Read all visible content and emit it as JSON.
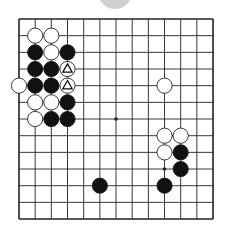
{
  "board": {
    "size": 13,
    "origin_x": 19,
    "origin_y": 19,
    "spacing_x": 16.17,
    "spacing_y": 16.67,
    "line_color": "#222222",
    "background": "#ffffff",
    "star_points": [
      [
        6,
        6
      ],
      [
        9,
        9
      ]
    ]
  },
  "indicator": {
    "shape": "circle",
    "cx": 115,
    "cy": -8,
    "r": 17,
    "color": "#d0d0d0"
  },
  "stones": [
    {
      "color": "white",
      "col": 1,
      "row": 1
    },
    {
      "color": "white",
      "col": 2,
      "row": 1
    },
    {
      "color": "black",
      "col": 1,
      "row": 2
    },
    {
      "color": "white",
      "col": 2,
      "row": 2
    },
    {
      "color": "black",
      "col": 3,
      "row": 2
    },
    {
      "color": "black",
      "col": 1,
      "row": 3
    },
    {
      "color": "black",
      "col": 2,
      "row": 3
    },
    {
      "color": "white",
      "col": 3,
      "row": 3,
      "mark": "triangle"
    },
    {
      "color": "white",
      "col": 0,
      "row": 4
    },
    {
      "color": "black",
      "col": 1,
      "row": 4
    },
    {
      "color": "black",
      "col": 2,
      "row": 4
    },
    {
      "color": "white",
      "col": 3,
      "row": 4,
      "mark": "triangle"
    },
    {
      "color": "white",
      "col": 1,
      "row": 5
    },
    {
      "color": "white",
      "col": 2,
      "row": 5
    },
    {
      "color": "black",
      "col": 3,
      "row": 5
    },
    {
      "color": "white",
      "col": 1,
      "row": 6
    },
    {
      "color": "black",
      "col": 2,
      "row": 6
    },
    {
      "color": "black",
      "col": 3,
      "row": 6
    },
    {
      "color": "white",
      "col": 9,
      "row": 4
    },
    {
      "color": "white",
      "col": 9,
      "row": 7
    },
    {
      "color": "white",
      "col": 10,
      "row": 7
    },
    {
      "color": "white",
      "col": 9,
      "row": 8
    },
    {
      "color": "black",
      "col": 10,
      "row": 8
    },
    {
      "color": "black",
      "col": 10,
      "row": 9
    },
    {
      "color": "black",
      "col": 5,
      "row": 10
    },
    {
      "color": "black",
      "col": 9,
      "row": 10
    }
  ],
  "colors": {
    "black_stone": "#111111",
    "white_stone": "#ffffff",
    "stone_outline": "#222222",
    "mark": "#111111"
  }
}
